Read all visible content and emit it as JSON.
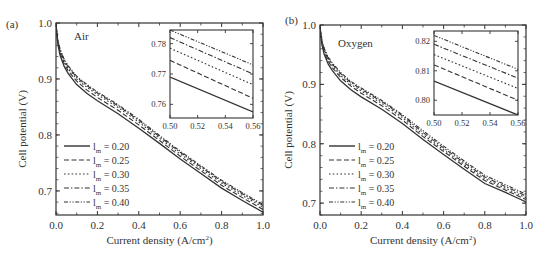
{
  "chart_data": [
    {
      "panel_label": "(a)",
      "type": "line",
      "title": "Air",
      "xlabel": "Current density (A/cm²)",
      "ylabel": "Cell potential (V)",
      "xlim": [
        0.0,
        1.0
      ],
      "ylim": [
        0.657,
        1.0
      ],
      "xticks": [
        0.0,
        0.2,
        0.4,
        0.6,
        0.8,
        1.0
      ],
      "xtick_labels": [
        "0.0",
        "0.2",
        "0.4",
        "0.6",
        "0.8",
        "1.0"
      ],
      "yticks": [
        0.7,
        0.8,
        0.9,
        1.0
      ],
      "ytick_labels": [
        "0.7",
        "0.8",
        "0.9",
        "1.0"
      ],
      "grid": false,
      "legend_position": "lower left",
      "x": [
        0.0,
        0.005,
        0.01,
        0.02,
        0.04,
        0.06,
        0.1,
        0.15,
        0.2,
        0.3,
        0.4,
        0.5,
        0.6,
        0.7,
        0.8,
        0.9,
        1.0
      ],
      "series": [
        {
          "name": "l_m = 0.20",
          "dash": "solid",
          "values": [
            1.0,
            0.975,
            0.96,
            0.942,
            0.922,
            0.909,
            0.89,
            0.874,
            0.861,
            0.838,
            0.812,
            0.785,
            0.757,
            0.731,
            0.705,
            0.683,
            0.662
          ]
        },
        {
          "name": "l_m = 0.25",
          "dash": "dashed",
          "values": [
            1.0,
            0.977,
            0.963,
            0.946,
            0.927,
            0.914,
            0.896,
            0.88,
            0.867,
            0.844,
            0.818,
            0.79,
            0.762,
            0.736,
            0.71,
            0.688,
            0.667
          ]
        },
        {
          "name": "l_m = 0.30",
          "dash": "dotted",
          "values": [
            1.0,
            0.978,
            0.965,
            0.949,
            0.93,
            0.918,
            0.9,
            0.885,
            0.872,
            0.849,
            0.823,
            0.794,
            0.766,
            0.74,
            0.714,
            0.692,
            0.671
          ]
        },
        {
          "name": "l_m = 0.35",
          "dash": "dash-dot",
          "values": [
            1.0,
            0.979,
            0.967,
            0.951,
            0.933,
            0.921,
            0.903,
            0.888,
            0.875,
            0.852,
            0.826,
            0.797,
            0.769,
            0.743,
            0.717,
            0.695,
            0.674
          ]
        },
        {
          "name": "l_m = 0.40",
          "dash": "dash-dot-dot",
          "values": [
            1.0,
            0.98,
            0.968,
            0.953,
            0.935,
            0.923,
            0.905,
            0.89,
            0.877,
            0.854,
            0.828,
            0.799,
            0.771,
            0.745,
            0.719,
            0.697,
            0.676
          ]
        }
      ],
      "inset": {
        "xlim": [
          0.5,
          0.56
        ],
        "ylim": [
          0.7555,
          0.7845
        ],
        "xticks": [
          0.5,
          0.52,
          0.54,
          0.56
        ],
        "xtick_labels": [
          "0.50",
          "0.52",
          "0.54",
          "0.56"
        ],
        "yticks": [
          0.76,
          0.77,
          0.78
        ],
        "ytick_labels": [
          "0.76",
          "0.77",
          "0.78"
        ],
        "x": [
          0.5,
          0.56
        ],
        "series": [
          {
            "name": "l_m = 0.20",
            "dash": "solid",
            "values": [
              0.769,
              0.7575
            ]
          },
          {
            "name": "l_m = 0.25",
            "dash": "dashed",
            "values": [
              0.7745,
              0.762
            ]
          },
          {
            "name": "l_m = 0.30",
            "dash": "dotted",
            "values": [
              0.7785,
              0.7665
            ]
          },
          {
            "name": "l_m = 0.35",
            "dash": "dash-dot",
            "values": [
              0.782,
              0.77
            ]
          },
          {
            "name": "l_m = 0.40",
            "dash": "dash-dot-dot",
            "values": [
              0.7845,
              0.773
            ]
          }
        ]
      }
    },
    {
      "panel_label": "(b)",
      "type": "line",
      "title": "Oxygen",
      "xlabel": "Current density (A/cm²)",
      "ylabel": "Cell potential (V)",
      "xlim": [
        0.0,
        1.0
      ],
      "ylim": [
        0.68,
        1.0
      ],
      "xticks": [
        0.0,
        0.2,
        0.4,
        0.6,
        0.8,
        1.0
      ],
      "xtick_labels": [
        "0.0",
        "0.2",
        "0.4",
        "0.6",
        "0.8",
        "1.0"
      ],
      "yticks": [
        0.7,
        0.8,
        0.9,
        1.0
      ],
      "ytick_labels": [
        "0.7",
        "0.8",
        "0.9",
        "1.0"
      ],
      "grid": false,
      "legend_position": "lower left",
      "x": [
        0.0,
        0.005,
        0.01,
        0.02,
        0.04,
        0.06,
        0.1,
        0.15,
        0.2,
        0.3,
        0.4,
        0.5,
        0.6,
        0.7,
        0.8,
        0.9,
        1.0
      ],
      "series": [
        {
          "name": "l_m = 0.20",
          "dash": "solid",
          "values": [
            1.0,
            0.978,
            0.966,
            0.951,
            0.934,
            0.923,
            0.906,
            0.891,
            0.879,
            0.858,
            0.834,
            0.807,
            0.782,
            0.757,
            0.733,
            0.718,
            0.702
          ]
        },
        {
          "name": "l_m = 0.25",
          "dash": "dashed",
          "values": [
            1.0,
            0.98,
            0.969,
            0.955,
            0.939,
            0.928,
            0.912,
            0.897,
            0.885,
            0.864,
            0.84,
            0.812,
            0.787,
            0.762,
            0.738,
            0.722,
            0.706
          ]
        },
        {
          "name": "l_m = 0.30",
          "dash": "dotted",
          "values": [
            1.0,
            0.981,
            0.971,
            0.958,
            0.942,
            0.931,
            0.915,
            0.9,
            0.889,
            0.868,
            0.844,
            0.8155,
            0.79,
            0.765,
            0.741,
            0.725,
            0.709
          ]
        },
        {
          "name": "l_m = 0.35",
          "dash": "dash-dot",
          "values": [
            1.0,
            0.982,
            0.972,
            0.96,
            0.944,
            0.934,
            0.918,
            0.903,
            0.892,
            0.871,
            0.847,
            0.819,
            0.793,
            0.768,
            0.744,
            0.728,
            0.712
          ]
        },
        {
          "name": "l_m = 0.40",
          "dash": "dash-dot-dot",
          "values": [
            1.0,
            0.983,
            0.973,
            0.961,
            0.946,
            0.936,
            0.92,
            0.905,
            0.894,
            0.873,
            0.849,
            0.822,
            0.796,
            0.771,
            0.747,
            0.731,
            0.715
          ]
        }
      ],
      "inset": {
        "xlim": [
          0.5,
          0.56
        ],
        "ylim": [
          0.795,
          0.8235
        ],
        "xticks": [
          0.5,
          0.52,
          0.54,
          0.56
        ],
        "xtick_labels": [
          "0.50",
          "0.52",
          "0.54",
          "0.56"
        ],
        "yticks": [
          0.8,
          0.81,
          0.82
        ],
        "ytick_labels": [
          "0.80",
          "0.81",
          "0.82"
        ],
        "x": [
          0.5,
          0.56
        ],
        "series": [
          {
            "name": "l_m = 0.20",
            "dash": "solid",
            "values": [
              0.8065,
              0.795
            ]
          },
          {
            "name": "l_m = 0.25",
            "dash": "dashed",
            "values": [
              0.812,
              0.8
            ]
          },
          {
            "name": "l_m = 0.30",
            "dash": "dotted",
            "values": [
              0.8155,
              0.804
            ]
          },
          {
            "name": "l_m = 0.35",
            "dash": "dash-dot",
            "values": [
              0.819,
              0.8075
            ]
          },
          {
            "name": "l_m = 0.40",
            "dash": "dash-dot-dot",
            "values": [
              0.822,
              0.8105
            ]
          }
        ]
      }
    }
  ],
  "legend": {
    "entries": [
      {
        "symbol": "l",
        "sub": "m",
        "value": " = 0.20",
        "dash": "solid"
      },
      {
        "symbol": "l",
        "sub": "m",
        "value": " = 0.25",
        "dash": "dashed"
      },
      {
        "symbol": "l",
        "sub": "m",
        "value": " = 0.30",
        "dash": "dotted"
      },
      {
        "symbol": "l",
        "sub": "m",
        "value": " = 0.35",
        "dash": "dash-dot"
      },
      {
        "symbol": "l",
        "sub": "m",
        "value": " = 0.40",
        "dash": "dash-dot-dot"
      }
    ]
  },
  "layout": {
    "panels": [
      {
        "left": 56,
        "top": 23,
        "right": 263,
        "bottom": 215,
        "inset": {
          "left": 170,
          "top": 30,
          "right": 253,
          "bottom": 118
        },
        "legend": {
          "x": 64,
          "y": 146
        },
        "title_pos": {
          "x": 74,
          "y": 40
        },
        "label_pos": {
          "x": 6,
          "y": 28
        }
      },
      {
        "left": 320,
        "top": 25,
        "right": 526,
        "bottom": 215,
        "inset": {
          "left": 434,
          "top": 31,
          "right": 518,
          "bottom": 115
        },
        "legend": {
          "x": 329,
          "y": 146
        },
        "title_pos": {
          "x": 338,
          "y": 47
        },
        "label_pos": {
          "x": 285,
          "y": 24
        }
      }
    ],
    "line_color": "#333333",
    "axis_color": "#333333"
  }
}
